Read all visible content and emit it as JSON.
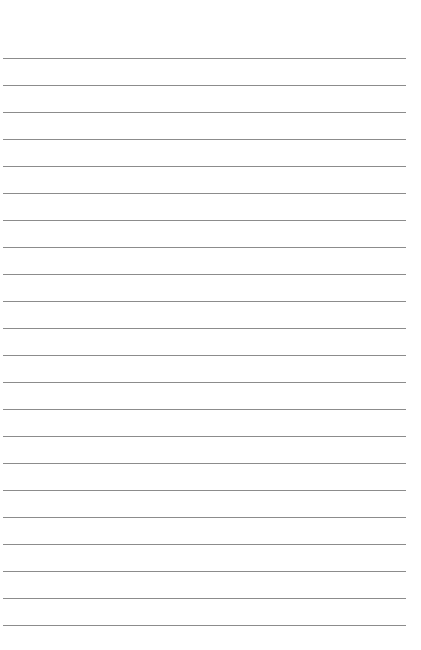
{
  "page": {
    "type": "lined-paper",
    "background_color": "#ffffff",
    "rule_color": "#8c8c8c",
    "rule_count": 22,
    "first_rule_y": 58,
    "rule_spacing": 27,
    "rule_left": 3,
    "rule_width": 403
  }
}
